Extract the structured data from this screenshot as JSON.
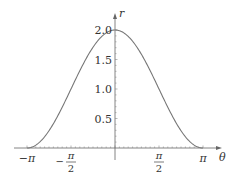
{
  "chart_data": {
    "type": "line",
    "title": "",
    "xlabel": "θ",
    "ylabel": "r",
    "function": "r = 1 + cos(θ)",
    "xlim": [
      -3.14159,
      3.14159
    ],
    "ylim": [
      0,
      2.0
    ],
    "x_ticks": [
      {
        "value": -3.14159,
        "label": "−π"
      },
      {
        "value": -1.5708,
        "label_num": "π",
        "label_den": "2",
        "sign": "−"
      },
      {
        "value": 1.5708,
        "label_num": "π",
        "label_den": "2",
        "sign": ""
      },
      {
        "value": 3.14159,
        "label": "π"
      }
    ],
    "y_ticks": [
      {
        "value": 0.5,
        "label": "0.5"
      },
      {
        "value": 1.0,
        "label": "1.0"
      },
      {
        "value": 1.5,
        "label": "1.5"
      },
      {
        "value": 2.0,
        "label": "2.0"
      }
    ],
    "series": [
      {
        "name": "r",
        "x": [
          -3.14159,
          -2.35619,
          -1.5708,
          -0.7854,
          0,
          0.7854,
          1.5708,
          2.35619,
          3.14159
        ],
        "values": [
          0,
          0.293,
          1.0,
          1.707,
          2.0,
          1.707,
          1.0,
          0.293,
          0
        ]
      }
    ],
    "grid": false,
    "legend": null
  },
  "colors": {
    "curve": "#777777",
    "axis": "#555555",
    "text": "#333333"
  }
}
